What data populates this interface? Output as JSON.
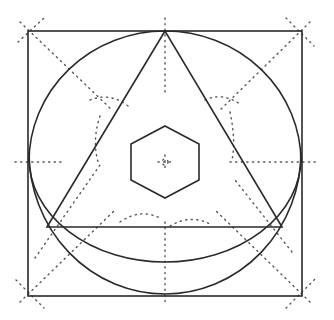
{
  "diagram": {
    "title": "",
    "colors": {
      "stroke": "#2a2a2a",
      "construction": "#555555",
      "background": "#ffffff"
    },
    "shapes": [
      {
        "name": "outer-square",
        "kind": "square",
        "style": "solid"
      },
      {
        "name": "circle-upper",
        "kind": "arc",
        "style": "solid"
      },
      {
        "name": "circle-lower-outer-arc",
        "kind": "arc",
        "style": "solid"
      },
      {
        "name": "circle-lower-inner-arc",
        "kind": "arc",
        "style": "solid"
      },
      {
        "name": "triangle",
        "kind": "triangle",
        "style": "solid"
      },
      {
        "name": "center-hexagon",
        "kind": "hexagon",
        "style": "solid"
      },
      {
        "name": "construction-lines",
        "kind": "lines",
        "style": "dotted"
      }
    ],
    "labels": []
  }
}
